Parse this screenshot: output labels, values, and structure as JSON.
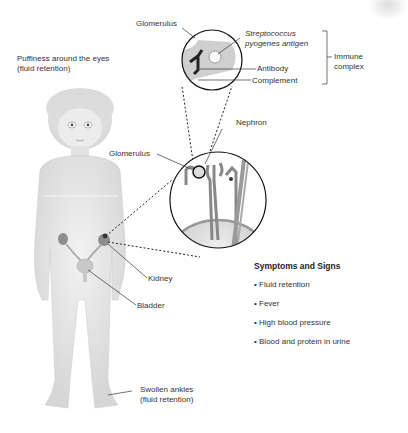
{
  "labels": {
    "puffiness_line1": "Puffiness around the eyes",
    "puffiness_line2": "(fluid retention)",
    "glomerulus_top": "Glomerulus",
    "strep_line1": "Streptococcus",
    "strep_line2": "pyogenes antigen",
    "antibody": "Antibody",
    "complement": "Complement",
    "immune_line1": "Immune",
    "immune_line2": "complex",
    "nephron": "Nephron",
    "glomerulus_mid": "Glomerulus",
    "kidney": "Kidney",
    "bladder": "Bladder",
    "ankles_line1": "Swollen ankles",
    "ankles_line2": "(fluid retention)"
  },
  "symptoms": {
    "title": "Symptoms and Signs",
    "items": [
      "Fluid retention",
      "Fever",
      "High blood pressure",
      "Blood and protein in urine"
    ]
  },
  "colors": {
    "body": "#e4e4e4",
    "organ": "#9a9a9a",
    "line": "#222222"
  }
}
